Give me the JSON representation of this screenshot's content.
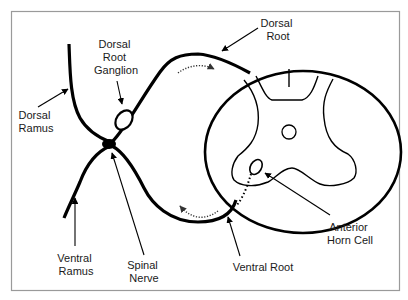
{
  "diagram": {
    "type": "anatomy",
    "labels": {
      "dorsal_root": [
        "Dorsal",
        "Root"
      ],
      "dorsal_root_ganglion": [
        "Dorsal",
        "Root",
        "Ganglion"
      ],
      "dorsal_ramus": [
        "Dorsal",
        "Ramus"
      ],
      "ventral_ramus": [
        "Ventral",
        "Ramus"
      ],
      "spinal_nerve": [
        "Spinal",
        "Nerve"
      ],
      "ventral_root": [
        "Ventral Root"
      ],
      "anterior_horn_cell": [
        "Anterior",
        "Horn Cell"
      ]
    },
    "colors": {
      "stroke": "#000000",
      "frame": "#9a9a9a",
      "background": "#ffffff",
      "text": "#1a1a1a"
    }
  }
}
